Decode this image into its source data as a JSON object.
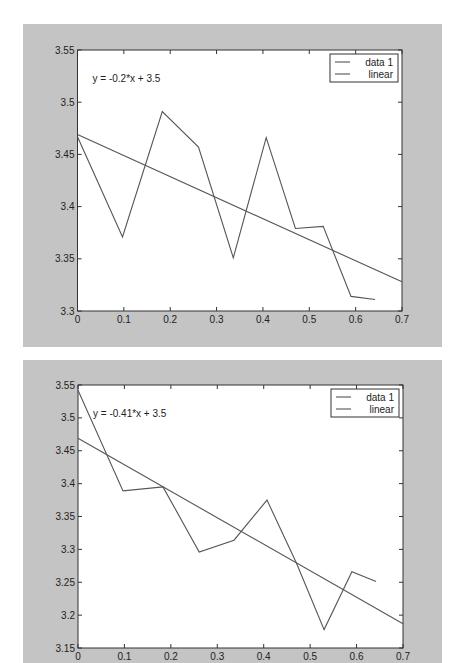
{
  "chart_data": [
    {
      "type": "line",
      "title": "",
      "xlabel": "",
      "ylabel": "",
      "xlim": [
        0,
        0.7
      ],
      "ylim": [
        3.3,
        3.55
      ],
      "xticks": [
        "0",
        "0.1",
        "0.2",
        "0.3",
        "0.4",
        "0.5",
        "0.6",
        "0.7"
      ],
      "xtick_values": [
        0,
        0.1,
        0.2,
        0.3,
        0.4,
        0.5,
        0.6,
        0.7
      ],
      "yticks": [
        "3.3",
        "3.35",
        "3.4",
        "3.45",
        "3.5",
        "3.55"
      ],
      "ytick_values": [
        3.3,
        3.35,
        3.4,
        3.45,
        3.5,
        3.55
      ],
      "grid": false,
      "legend_position": "top-right",
      "annotation": "y = -0.2*x + 3.5",
      "series": [
        {
          "name": "data 1",
          "x": [
            0,
            0.097,
            0.183,
            0.261,
            0.336,
            0.407,
            0.47,
            0.53,
            0.59,
            0.642
          ],
          "y": [
            3.467,
            3.371,
            3.491,
            3.457,
            3.351,
            3.466,
            3.379,
            3.381,
            3.314,
            3.311
          ],
          "color": "#555555"
        },
        {
          "name": "linear",
          "x": [
            0,
            0.7
          ],
          "y": [
            3.469,
            3.328
          ],
          "color": "#555555"
        }
      ]
    },
    {
      "type": "line",
      "title": "",
      "xlabel": "",
      "ylabel": "",
      "xlim": [
        0,
        0.7
      ],
      "ylim": [
        3.15,
        3.55
      ],
      "xticks": [
        "0",
        "0.1",
        "0.2",
        "0.3",
        "0.4",
        "0.5",
        "0.6",
        "0.7"
      ],
      "xtick_values": [
        0,
        0.1,
        0.2,
        0.3,
        0.4,
        0.5,
        0.6,
        0.7
      ],
      "yticks": [
        "3.15",
        "3.2",
        "3.25",
        "3.3",
        "3.35",
        "3.4",
        "3.45",
        "3.5",
        "3.55"
      ],
      "ytick_values": [
        3.15,
        3.2,
        3.25,
        3.3,
        3.35,
        3.4,
        3.45,
        3.5,
        3.55
      ],
      "grid": false,
      "legend_position": "top-right",
      "annotation": "y = -0.41*x + 3.5",
      "series": [
        {
          "name": "data 1",
          "x": [
            0,
            0.097,
            0.183,
            0.261,
            0.336,
            0.407,
            0.47,
            0.53,
            0.59,
            0.642
          ],
          "y": [
            3.542,
            3.389,
            3.395,
            3.296,
            3.314,
            3.375,
            3.28,
            3.178,
            3.266,
            3.251
          ],
          "color": "#555555"
        },
        {
          "name": "linear",
          "x": [
            0,
            0.7
          ],
          "y": [
            3.469,
            3.187
          ],
          "color": "#555555"
        }
      ]
    }
  ]
}
